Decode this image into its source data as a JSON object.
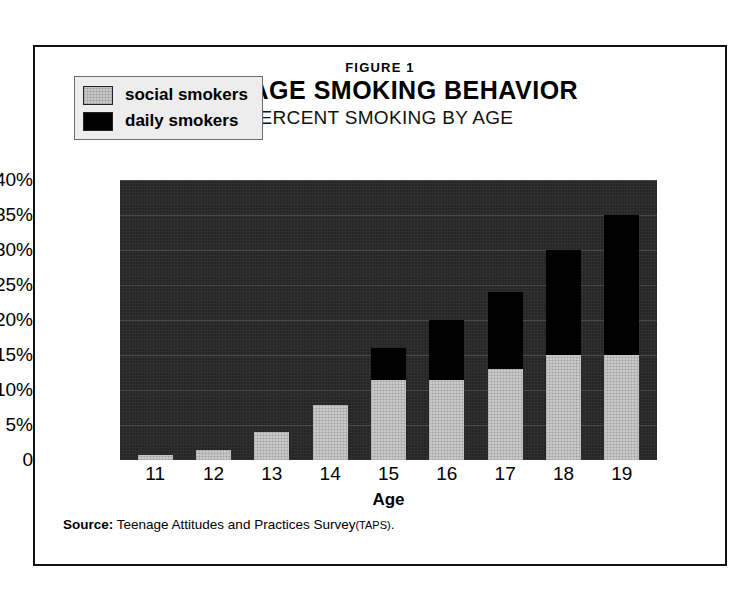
{
  "figure": {
    "label": "FIGURE 1",
    "title": "TEENAGE SMOKING BEHAVIOR",
    "subtitle": "PERCENT SMOKING BY AGE"
  },
  "legend": {
    "items": [
      {
        "label": "social smokers",
        "swatch": "light-gray",
        "color": "#c9c9c9"
      },
      {
        "label": "daily smokers",
        "swatch": "black",
        "color": "#000000"
      }
    ]
  },
  "source": {
    "prefix": "Source:",
    "text": "Teenage Attitudes and Practices Survey",
    "abbrev": "(TAPS)",
    "suffix": "."
  },
  "chart_data": {
    "type": "bar",
    "stacked": true,
    "title": "TEENAGE SMOKING BEHAVIOR",
    "subtitle": "PERCENT SMOKING BY AGE",
    "xlabel": "Age",
    "ylabel": "",
    "ylim": [
      0,
      40
    ],
    "yticks": [
      40,
      35,
      30,
      25,
      20,
      15,
      10,
      5,
      0
    ],
    "ytick_labels": [
      "40%",
      "35%",
      "30%",
      "25%",
      "20%",
      "15%",
      "10%",
      "5%",
      "0"
    ],
    "grid": true,
    "legend_position": "upper-left-inside",
    "categories": [
      "11",
      "12",
      "13",
      "14",
      "15",
      "16",
      "17",
      "18",
      "19"
    ],
    "series": [
      {
        "name": "social smokers",
        "color": "#c9c9c9",
        "values": [
          0.7,
          1.5,
          4.0,
          7.8,
          11.5,
          11.5,
          13.0,
          15.0,
          15.0
        ]
      },
      {
        "name": "daily smokers",
        "color": "#000000",
        "values": [
          0.0,
          0.0,
          0.0,
          0.0,
          4.5,
          8.5,
          11.0,
          15.0,
          20.0
        ]
      }
    ],
    "totals": [
      0.7,
      1.5,
      4.0,
      7.8,
      16.0,
      20.0,
      24.0,
      30.0,
      35.0
    ]
  }
}
